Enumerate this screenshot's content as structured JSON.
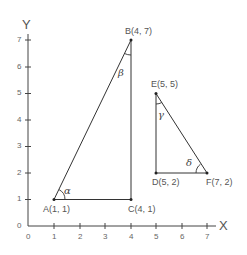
{
  "axes": {
    "x_title": "X",
    "y_title": "Y",
    "x_ticks": [
      "0",
      "1",
      "2",
      "3",
      "4",
      "5",
      "6",
      "7"
    ],
    "y_ticks": [
      "0",
      "1",
      "2",
      "3",
      "4",
      "5",
      "6",
      "7"
    ]
  },
  "points": {
    "A": "A(1, 1)",
    "B": "B(4, 7)",
    "C": "C(4, 1)",
    "D": "D(5, 2)",
    "E": "E(5, 5)",
    "F": "F(7, 2)"
  },
  "angles": {
    "alpha": "α",
    "beta": "β",
    "gamma": "γ",
    "delta": "δ"
  },
  "triangles": [
    {
      "name": "ABC",
      "vertices": [
        [
          1,
          1
        ],
        [
          4,
          7
        ],
        [
          4,
          1
        ]
      ]
    },
    {
      "name": "DEF",
      "vertices": [
        [
          5,
          2
        ],
        [
          5,
          5
        ],
        [
          7,
          2
        ]
      ]
    }
  ],
  "colors": {
    "line": "#333333",
    "text": "#555555"
  }
}
